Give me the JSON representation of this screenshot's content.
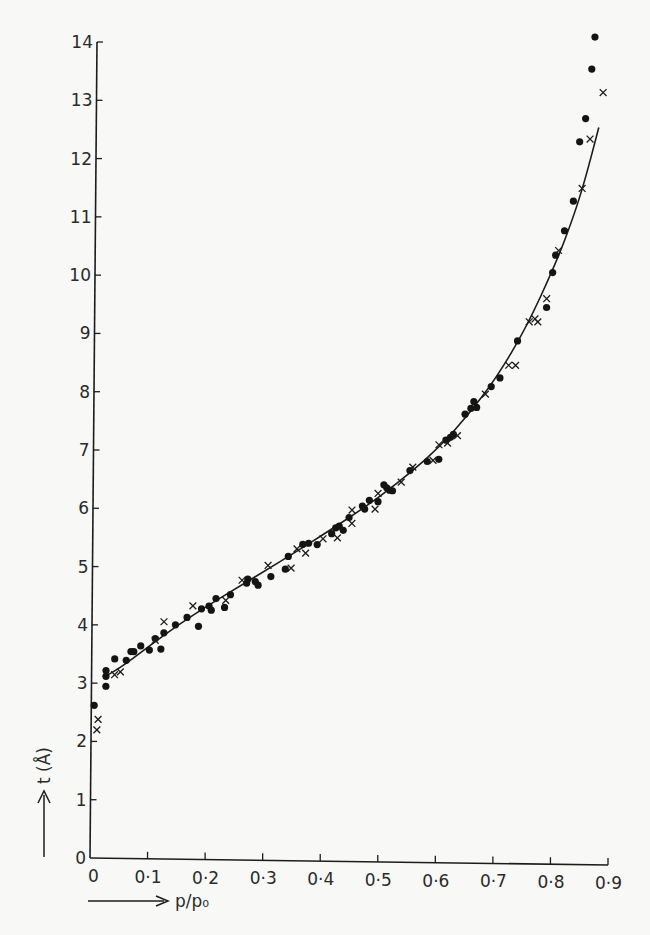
{
  "chart_data": {
    "type": "scatter",
    "title": "",
    "xlabel": "p/p₀",
    "ylabel": "t (Å)",
    "xlim": [
      0,
      0.9
    ],
    "ylim": [
      0,
      14
    ],
    "grid": false,
    "legend": null,
    "x_ticks": [
      "0",
      "0·1",
      "0·2",
      "0·3",
      "0·4",
      "0·5",
      "0·6",
      "0·7",
      "0·8",
      "0·9"
    ],
    "y_ticks": [
      "0",
      "1",
      "2",
      "3",
      "4",
      "5",
      "6",
      "7",
      "8",
      "9",
      "10",
      "11",
      "12",
      "13",
      "14"
    ],
    "series": [
      {
        "name": "filled circles",
        "marker": "dot",
        "points": [
          [
            0.005,
            2.62
          ],
          [
            0.025,
            2.95
          ],
          [
            0.025,
            3.12
          ],
          [
            0.025,
            3.22
          ],
          [
            0.04,
            3.42
          ],
          [
            0.06,
            3.4
          ],
          [
            0.068,
            3.55
          ],
          [
            0.073,
            3.55
          ],
          [
            0.085,
            3.65
          ],
          [
            0.1,
            3.58
          ],
          [
            0.11,
            3.78
          ],
          [
            0.12,
            3.6
          ],
          [
            0.125,
            3.88
          ],
          [
            0.145,
            4.02
          ],
          [
            0.165,
            4.15
          ],
          [
            0.185,
            4.0
          ],
          [
            0.19,
            4.3
          ],
          [
            0.203,
            4.35
          ],
          [
            0.207,
            4.28
          ],
          [
            0.215,
            4.48
          ],
          [
            0.23,
            4.33
          ],
          [
            0.24,
            4.55
          ],
          [
            0.268,
            4.75
          ],
          [
            0.27,
            4.82
          ],
          [
            0.283,
            4.78
          ],
          [
            0.288,
            4.72
          ],
          [
            0.31,
            4.87
          ],
          [
            0.335,
            5.0
          ],
          [
            0.34,
            5.22
          ],
          [
            0.365,
            5.43
          ],
          [
            0.375,
            5.45
          ],
          [
            0.39,
            5.43
          ],
          [
            0.415,
            5.62
          ],
          [
            0.422,
            5.72
          ],
          [
            0.428,
            5.75
          ],
          [
            0.435,
            5.68
          ],
          [
            0.445,
            5.9
          ],
          [
            0.468,
            6.1
          ],
          [
            0.472,
            6.05
          ],
          [
            0.48,
            6.2
          ],
          [
            0.495,
            6.18
          ],
          [
            0.505,
            6.47
          ],
          [
            0.51,
            6.42
          ],
          [
            0.515,
            6.38
          ],
          [
            0.52,
            6.37
          ],
          [
            0.55,
            6.72
          ],
          [
            0.58,
            6.88
          ],
          [
            0.6,
            6.92
          ],
          [
            0.612,
            7.25
          ],
          [
            0.62,
            7.3
          ],
          [
            0.625,
            7.35
          ],
          [
            0.645,
            7.7
          ],
          [
            0.655,
            7.8
          ],
          [
            0.66,
            7.92
          ],
          [
            0.665,
            7.82
          ],
          [
            0.69,
            8.18
          ],
          [
            0.705,
            8.33
          ],
          [
            0.735,
            8.97
          ],
          [
            0.785,
            9.55
          ],
          [
            0.795,
            10.15
          ],
          [
            0.8,
            10.45
          ],
          [
            0.815,
            10.87
          ],
          [
            0.83,
            11.38
          ],
          [
            0.84,
            12.4
          ],
          [
            0.85,
            12.8
          ],
          [
            0.86,
            13.65
          ],
          [
            0.865,
            14.2
          ]
        ]
      },
      {
        "name": "crosses",
        "marker": "x",
        "points": [
          [
            0.01,
            2.2
          ],
          [
            0.012,
            2.38
          ],
          [
            0.04,
            3.15
          ],
          [
            0.05,
            3.2
          ],
          [
            0.11,
            3.75
          ],
          [
            0.125,
            4.07
          ],
          [
            0.175,
            4.35
          ],
          [
            0.232,
            4.45
          ],
          [
            0.26,
            4.8
          ],
          [
            0.305,
            5.06
          ],
          [
            0.345,
            5.02
          ],
          [
            0.355,
            5.35
          ],
          [
            0.37,
            5.28
          ],
          [
            0.4,
            5.53
          ],
          [
            0.425,
            5.55
          ],
          [
            0.45,
            6.03
          ],
          [
            0.45,
            5.8
          ],
          [
            0.49,
            6.05
          ],
          [
            0.495,
            6.32
          ],
          [
            0.535,
            6.52
          ],
          [
            0.555,
            6.78
          ],
          [
            0.59,
            6.9
          ],
          [
            0.6,
            7.17
          ],
          [
            0.615,
            7.2
          ],
          [
            0.632,
            7.33
          ],
          [
            0.68,
            8.05
          ],
          [
            0.72,
            8.55
          ],
          [
            0.732,
            8.55
          ],
          [
            0.755,
            9.3
          ],
          [
            0.765,
            9.35
          ],
          [
            0.77,
            9.3
          ],
          [
            0.785,
            9.7
          ],
          [
            0.805,
            10.53
          ],
          [
            0.845,
            11.6
          ],
          [
            0.858,
            12.45
          ],
          [
            0.88,
            13.25
          ]
        ]
      },
      {
        "name": "fitted curve",
        "marker": "line",
        "points": [
          [
            0.02,
            3.1
          ],
          [
            0.05,
            3.27
          ],
          [
            0.1,
            3.65
          ],
          [
            0.15,
            4.02
          ],
          [
            0.2,
            4.35
          ],
          [
            0.25,
            4.66
          ],
          [
            0.3,
            4.97
          ],
          [
            0.35,
            5.28
          ],
          [
            0.4,
            5.6
          ],
          [
            0.45,
            5.93
          ],
          [
            0.5,
            6.28
          ],
          [
            0.55,
            6.68
          ],
          [
            0.6,
            7.12
          ],
          [
            0.65,
            7.68
          ],
          [
            0.7,
            8.35
          ],
          [
            0.75,
            9.2
          ],
          [
            0.8,
            10.3
          ],
          [
            0.83,
            11.1
          ],
          [
            0.85,
            11.75
          ],
          [
            0.873,
            12.65
          ]
        ]
      }
    ]
  }
}
